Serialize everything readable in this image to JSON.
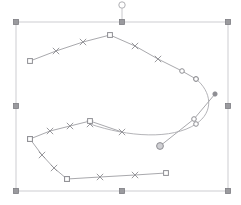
{
  "canvas": {
    "width": 241,
    "height": 205,
    "background_color": "#ffffff"
  },
  "colors": {
    "path_stroke": "#a9a9ad",
    "curve_stroke": "#b4b4b8",
    "node_marker": "#8e8e93",
    "selection_box": "#c8c8cc",
    "handle_fill": "#9a9a9e",
    "handle_stroke": "#7d7d82",
    "rotate_handle_fill": "#ffffff",
    "rotate_handle_stroke": "#b0b0b4"
  },
  "selection": {
    "label": "selection-bounding-box",
    "bbox": {
      "x": 16,
      "y": 22,
      "width": 212,
      "height": 169
    },
    "handles": [
      {
        "name": "handle-top-left",
        "x": 16,
        "y": 22
      },
      {
        "name": "handle-top-center",
        "x": 122,
        "y": 22
      },
      {
        "name": "handle-top-right",
        "x": 228,
        "y": 22
      },
      {
        "name": "handle-middle-left",
        "x": 16,
        "y": 106
      },
      {
        "name": "handle-middle-right",
        "x": 228,
        "y": 106
      },
      {
        "name": "handle-bottom-left",
        "x": 16,
        "y": 191
      },
      {
        "name": "handle-bottom-center",
        "x": 122,
        "y": 191
      },
      {
        "name": "handle-bottom-right",
        "x": 228,
        "y": 191
      }
    ],
    "handle_size": 5,
    "rotate_handle": {
      "name": "rotate-handle",
      "cx": 122,
      "cy": 5,
      "r": 3.2,
      "stem_from_y": 8,
      "stem_to_y": 22
    }
  },
  "chart_data": {
    "type": "scatter",
    "title": "",
    "xlabel": "",
    "ylabel": "",
    "paths": [
      {
        "name": "upper-polyline",
        "type": "polyline",
        "closed": false,
        "points": [
          [
            30,
            61
          ],
          [
            56,
            51
          ],
          [
            83,
            42
          ],
          [
            110,
            35
          ],
          [
            135,
            46
          ],
          [
            158,
            59
          ],
          [
            182,
            71
          ],
          [
            196,
            79
          ]
        ],
        "node_markers": [
          "square",
          "cross",
          "cross",
          "square",
          "cross",
          "cross",
          "circle",
          "circle"
        ]
      },
      {
        "name": "right-bezier-curve",
        "type": "bezier",
        "closed": false,
        "start": [
          196,
          79
        ],
        "segments": [
          {
            "c1": [
              212,
              92
            ],
            "c2": [
              214,
              112
            ],
            "end": [
              196,
              124
            ]
          },
          {
            "c1": [
              172,
              140
            ],
            "c2": [
              128,
              137
            ],
            "end": [
              90,
              124
            ]
          }
        ],
        "node_markers": [
          "circle",
          "circle",
          "cross"
        ]
      },
      {
        "name": "middle-polyline",
        "type": "polyline",
        "closed": false,
        "points": [
          [
            122,
            132
          ],
          [
            90,
            121
          ],
          [
            70,
            126
          ],
          [
            50,
            131
          ],
          [
            30,
            139
          ]
        ],
        "node_markers": [
          "cross",
          "square",
          "cross",
          "cross",
          "square"
        ]
      },
      {
        "name": "lower-left-polyline",
        "type": "polyline",
        "closed": false,
        "points": [
          [
            30,
            139
          ],
          [
            42,
            155
          ],
          [
            54,
            168
          ],
          [
            67,
            179
          ]
        ],
        "node_markers": [
          "square",
          "cross",
          "cross",
          "square"
        ]
      },
      {
        "name": "bottom-polyline",
        "type": "polyline",
        "closed": false,
        "points": [
          [
            67,
            179
          ],
          [
            100,
            177
          ],
          [
            135,
            175
          ],
          [
            166,
            173
          ]
        ],
        "node_markers": [
          "square",
          "cross",
          "cross",
          "square"
        ]
      },
      {
        "name": "diagonal-connector",
        "type": "polyline",
        "closed": false,
        "points": [
          [
            160,
            146
          ],
          [
            194,
            119
          ],
          [
            215,
            94
          ]
        ],
        "node_markers": [
          "circle-large",
          "circle",
          "dot"
        ]
      }
    ],
    "legend": [],
    "grid": false
  },
  "accessibility": {
    "object_label": "vector-path-selection"
  }
}
